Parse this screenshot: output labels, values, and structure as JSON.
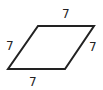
{
  "figure": {
    "shape": "rhombus",
    "stroke_color": "#222222",
    "side_labels": {
      "top": "7",
      "left": "7",
      "right": "7",
      "bottom": "7"
    }
  }
}
